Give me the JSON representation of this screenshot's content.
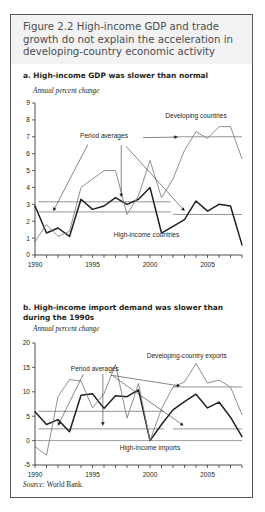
{
  "figure": {
    "title": "Figure 2.2  High-income GDP and trade growth do not explain the acceleration in developing-country economic activity",
    "source": "Source:",
    "source_value": " World Bank."
  },
  "panel_a": {
    "heading": "a. High-income GDP was slower than normal",
    "axis_caption": "Annual percent change"
  },
  "panel_b": {
    "heading": "b. High-income import demand was slower than during the 1990s",
    "axis_caption": "Annual percent change"
  },
  "chart_data": [
    {
      "type": "line",
      "id": "panel-a",
      "title": "a. High-income GDP was slower than normal",
      "ylabel": "Annual percent change",
      "xlabel": "",
      "ylim": [
        0,
        9
      ],
      "ytick_labels": [
        "0",
        "1",
        "2",
        "3",
        "4",
        "5",
        "6",
        "7",
        "8",
        "9"
      ],
      "yticks": [
        0,
        1,
        2,
        3,
        4,
        5,
        6,
        7,
        8,
        9
      ],
      "xlim": [
        1990,
        2008
      ],
      "xticks": [
        1990,
        1991,
        1992,
        1993,
        1994,
        1995,
        1996,
        1997,
        1998,
        1999,
        2000,
        2001,
        2002,
        2003,
        2004,
        2005,
        2006,
        2007,
        2008
      ],
      "xtick_labels_shown": [
        "1990",
        "1995",
        "2000",
        "2005"
      ],
      "grid": false,
      "legend_position": "inline-annotations",
      "x": [
        1990,
        1991,
        1992,
        1993,
        1994,
        1995,
        1996,
        1997,
        1998,
        1999,
        2000,
        2001,
        2002,
        2003,
        2004,
        2005,
        2006,
        2007,
        2008
      ],
      "series": [
        {
          "name": "High-income countries",
          "style": "dark-thick",
          "values": [
            2.9,
            1.3,
            1.6,
            1.1,
            3.3,
            2.7,
            2.9,
            3.4,
            3.0,
            3.3,
            4.0,
            1.3,
            1.7,
            2.1,
            3.2,
            2.6,
            3.0,
            2.9,
            0.6
          ]
        },
        {
          "name": "Developing countries",
          "style": "light-thin",
          "values": [
            0.8,
            1.8,
            1.1,
            1.4,
            4.0,
            4.5,
            5.0,
            5.0,
            2.4,
            3.5,
            5.6,
            3.4,
            4.5,
            6.2,
            7.3,
            6.9,
            7.6,
            7.6,
            5.7
          ]
        }
      ],
      "reference_lines": [
        {
          "label": "Period averages",
          "value": 3.15,
          "x_start": 1990.3,
          "x_end": 2001.8
        },
        {
          "label": "Period averages",
          "value": 2.55,
          "x_start": 1990.3,
          "x_end": 2001.8
        },
        {
          "label": "Period averages",
          "value": 7.0,
          "x_start": 2002.0,
          "x_end": 2008.0
        },
        {
          "label": "Period averages",
          "value": 2.4,
          "x_start": 2002.0,
          "x_end": 2008.0
        }
      ],
      "annotations": [
        {
          "text": "Developing countries",
          "x": 2004.0,
          "y": 8.1
        },
        {
          "text": "High-income countries",
          "x": 1999.7,
          "y": 1.05
        },
        {
          "text": "Period averages",
          "x": 1996.0,
          "y": 6.95
        }
      ]
    },
    {
      "type": "line",
      "id": "panel-b",
      "title": "b. High-income import demand was slower than during the 1990s",
      "ylabel": "Annual percent change",
      "xlabel": "",
      "ylim": [
        -5,
        20
      ],
      "ytick_labels": [
        "-5",
        "0",
        "5",
        "10",
        "15",
        "20"
      ],
      "yticks": [
        -5,
        0,
        5,
        10,
        15,
        20
      ],
      "xlim": [
        1990,
        2008
      ],
      "xticks": [
        1990,
        1991,
        1992,
        1993,
        1994,
        1995,
        1996,
        1997,
        1998,
        1999,
        2000,
        2001,
        2002,
        2003,
        2004,
        2005,
        2006,
        2007,
        2008
      ],
      "xtick_labels_shown": [
        "1990",
        "1995",
        "2000",
        "2005"
      ],
      "grid": false,
      "legend_position": "inline-annotations",
      "x": [
        1990,
        1991,
        1992,
        1993,
        1994,
        1995,
        1996,
        1997,
        1998,
        1999,
        2000,
        2001,
        2002,
        2003,
        2004,
        2005,
        2006,
        2007,
        2008
      ],
      "series": [
        {
          "name": "High-income imports",
          "style": "dark-thick",
          "values": [
            5.9,
            3.3,
            4.3,
            1.8,
            9.3,
            9.6,
            6.6,
            9.2,
            9.0,
            10.4,
            0.0,
            3.3,
            6.3,
            8.0,
            9.5,
            6.7,
            7.9,
            4.8,
            0.8
          ]
        },
        {
          "name": "Developing-country exports",
          "style": "light-thin",
          "values": [
            -1.2,
            -3.0,
            9.0,
            12.5,
            12.2,
            6.7,
            9.6,
            15.6,
            4.6,
            11.7,
            0.0,
            6.5,
            11.0,
            12.0,
            15.8,
            11.8,
            12.4,
            11.0,
            5.3
          ]
        }
      ],
      "reference_lines": [
        {
          "label": "Period averages",
          "value": 6.0,
          "x_start": 1990.3,
          "x_end": 2001.2
        },
        {
          "label": "Period averages",
          "value": 2.4,
          "x_start": 1990.3,
          "x_end": 2001.2
        },
        {
          "label": "Period averages",
          "value": 11.0,
          "x_start": 2002.0,
          "x_end": 2008.0
        },
        {
          "label": "Period averages",
          "value": 2.4,
          "x_start": 2002.0,
          "x_end": 2008.0
        },
        {
          "label": "zero",
          "value": 0.0,
          "x_start": 1990.0,
          "x_end": 2008.0
        }
      ],
      "annotations": [
        {
          "text": "Developing-country exports",
          "x": 2003.2,
          "y": 17.0
        },
        {
          "text": "High-income imports",
          "x": 2000.0,
          "y": -1.9
        },
        {
          "text": "Period averages",
          "x": 1995.2,
          "y": 14.2
        }
      ]
    }
  ]
}
